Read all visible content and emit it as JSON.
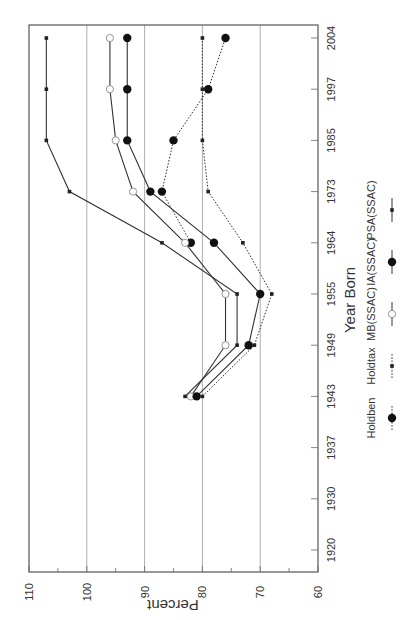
{
  "chart_data": {
    "type": "line",
    "orientation": "rotated-90-clockwise",
    "title": "",
    "xlabel": "Year Born",
    "ylabel": "Percent",
    "ylim": [
      60,
      110
    ],
    "y_ticks": [
      110,
      100,
      90,
      80,
      70,
      60
    ],
    "y_minor_step": 5,
    "gridlines_at": [
      100,
      90,
      80,
      70
    ],
    "grid": true,
    "categories": [
      "1920",
      "1930",
      "1937",
      "1943",
      "1949",
      "1955",
      "1964",
      "1973",
      "1985",
      "1997",
      "2004"
    ],
    "series": [
      {
        "name": "Holdben",
        "line_style": "dotted",
        "marker": "large-filled-circle",
        "values": [
          null,
          null,
          null,
          null,
          null,
          null,
          82,
          87,
          85,
          79,
          76
        ]
      },
      {
        "name": "Holdtax",
        "line_style": "dotted",
        "marker": "small-filled-square",
        "values": [
          null,
          null,
          null,
          80,
          71,
          68,
          73,
          79,
          80,
          80,
          80
        ]
      },
      {
        "name": "MB(SSAC)",
        "line_style": "solid",
        "marker": "open-circle",
        "values": [
          null,
          null,
          null,
          82,
          76,
          76,
          83,
          92,
          95,
          96,
          96
        ]
      },
      {
        "name": "IA(SSAC)",
        "line_style": "solid",
        "marker": "large-filled-circle",
        "values": [
          null,
          null,
          null,
          81,
          72,
          70,
          78,
          89,
          93,
          93,
          93
        ]
      },
      {
        "name": "PSA(SSAC)",
        "line_style": "solid",
        "marker": "small-filled-square",
        "values": [
          null,
          null,
          null,
          83,
          74,
          74,
          87,
          103,
          107,
          107,
          107
        ]
      }
    ],
    "legend": {
      "placement": "bottom-right",
      "entries": [
        "Holdben",
        "Holdtax",
        "MB(SSAC)",
        "IA(SSAC)",
        "PSA(SSAC)"
      ]
    }
  }
}
